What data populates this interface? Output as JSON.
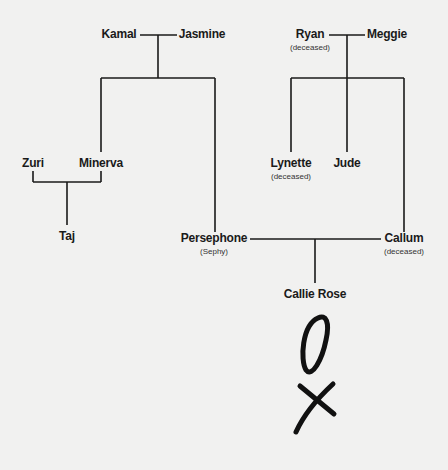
{
  "family_tree": {
    "people": [
      {
        "id": "kamal",
        "name": "Kamal",
        "note": ""
      },
      {
        "id": "jasmine",
        "name": "Jasmine",
        "note": ""
      },
      {
        "id": "ryan",
        "name": "Ryan",
        "note": "(deceased)"
      },
      {
        "id": "meggie",
        "name": "Meggie",
        "note": ""
      },
      {
        "id": "zuri",
        "name": "Zuri",
        "note": ""
      },
      {
        "id": "minerva",
        "name": "Minerva",
        "note": ""
      },
      {
        "id": "lynette",
        "name": "Lynette",
        "note": "(deceased)"
      },
      {
        "id": "jude",
        "name": "Jude",
        "note": ""
      },
      {
        "id": "taj",
        "name": "Taj",
        "note": ""
      },
      {
        "id": "persephone",
        "name": "Persephone",
        "note": "(Sephy)"
      },
      {
        "id": "callum",
        "name": "Callum",
        "note": "(deceased)"
      },
      {
        "id": "callie_rose",
        "name": "Callie Rose",
        "note": ""
      }
    ],
    "couples": [
      {
        "partners": [
          "Kamal",
          "Jasmine"
        ],
        "children": [
          "Minerva",
          "Persephone"
        ]
      },
      {
        "partners": [
          "Ryan",
          "Meggie"
        ],
        "children": [
          "Lynette",
          "Jude",
          "Callum"
        ]
      },
      {
        "partners": [
          "Zuri",
          "Minerva"
        ],
        "children": [
          "Taj"
        ]
      },
      {
        "partners": [
          "Persephone",
          "Callum"
        ],
        "children": [
          "Callie Rose"
        ]
      }
    ]
  },
  "handwriting": {
    "symbol_1": "O",
    "symbol_2": "X"
  },
  "colors": {
    "line": "#1a1a1a",
    "background": "#f1f1f0"
  }
}
